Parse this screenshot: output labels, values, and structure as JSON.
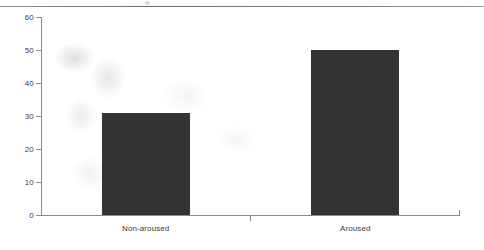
{
  "chart_data": {
    "type": "bar",
    "title": "",
    "subtitle": "",
    "xlabel": "",
    "ylabel": "",
    "categories": [
      "Non-aroused",
      "Aroused"
    ],
    "values": [
      31,
      50
    ],
    "series": [
      {
        "name": "",
        "values": [
          31,
          50
        ]
      }
    ],
    "ylim": [
      0,
      60
    ],
    "yticks": [
      0,
      10,
      20,
      30,
      40,
      50,
      60
    ],
    "ytick_labels": [
      "0",
      "10",
      "20",
      "30",
      "40",
      "50",
      "60"
    ],
    "grid": false,
    "legend": false,
    "legend_position": "none",
    "bar_color": "#333333",
    "axis_color": "#8a8a8a",
    "background": "#ffffff"
  },
  "artifacts": {
    "top_rule": true,
    "scan_speck": true,
    "scan_smudge": true
  }
}
